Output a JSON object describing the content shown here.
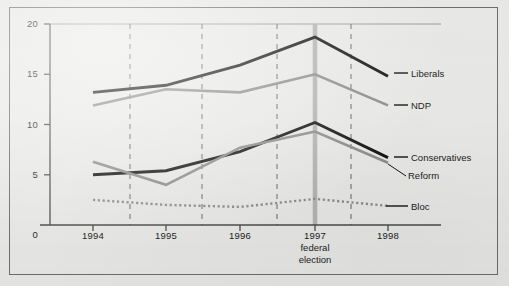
{
  "chart_data": {
    "type": "line",
    "title": "",
    "subtitle": "",
    "xlabel": "",
    "ylabel": "",
    "xlim": [
      1993.7,
      1998.3
    ],
    "ylim": [
      0,
      20
    ],
    "grid": "vertical-dashed-midyear",
    "legend_position": "right-inline",
    "y_ticks": [
      "0",
      "5",
      "10",
      "15",
      "20"
    ],
    "y_tick_values": [
      0,
      5,
      10,
      15,
      20
    ],
    "x_ticks": [
      "1994",
      "1995",
      "1996",
      "1997",
      "1998"
    ],
    "x_tick_values": [
      1994,
      1995,
      1996,
      1997,
      1998
    ],
    "annotation": {
      "line1": "1997",
      "line2": "federal",
      "line3": "election",
      "at_x": 1997,
      "marker_color": "#b4b4b4"
    },
    "x": [
      1994,
      1995,
      1996,
      1997,
      1998
    ],
    "series": [
      {
        "name": "Liberals",
        "label": "Liberals",
        "color": "#141414",
        "style": "solid",
        "width": 2.9,
        "values": [
          13.2,
          13.9,
          15.9,
          18.7,
          14.8
        ]
      },
      {
        "name": "NDP",
        "label": "NDP",
        "color": "#8d8d8d",
        "style": "solid",
        "width": 2.6,
        "values": [
          11.9,
          13.5,
          13.2,
          15.0,
          11.9
        ]
      },
      {
        "name": "Conservatives",
        "label": "Conservatives",
        "color": "#141414",
        "style": "solid",
        "width": 2.9,
        "values": [
          5.0,
          5.4,
          7.3,
          10.2,
          6.7
        ]
      },
      {
        "name": "Reform",
        "label": "Reform",
        "color": "#8d8d8d",
        "style": "solid",
        "width": 2.6,
        "values": [
          6.3,
          4.0,
          7.7,
          9.3,
          6.2
        ]
      },
      {
        "name": "Bloc",
        "label": "Bloc",
        "color": "#8d8d8d",
        "style": "dotted",
        "width": 2.4,
        "values": [
          2.5,
          2.0,
          1.8,
          2.6,
          1.9
        ]
      }
    ]
  },
  "axis": {
    "y_labels": [
      "20",
      "15",
      "10",
      "5",
      "0"
    ],
    "x_labels": [
      "1994",
      "1995",
      "1996",
      "1997",
      "1998"
    ]
  },
  "labels": {
    "liberals": "Liberals",
    "ndp": "NDP",
    "conservatives": "Conservatives",
    "reform": "Reform",
    "bloc": "Bloc",
    "year_1994": "1994",
    "year_1995": "1995",
    "year_1996": "1996",
    "year_1997": "1997",
    "year_1998": "1998",
    "y_20": "20",
    "y_15": "15",
    "y_10": "10",
    "y_5": "5",
    "y_0": "0",
    "election_1997": "1997",
    "election_federal": "federal",
    "election_election": "election"
  },
  "colors": {
    "background": "#e9e9e7",
    "frame": "#6e6e6e",
    "axis": "#4a4a4a",
    "dark_series": "#141414",
    "gray_series": "#8d8d8d",
    "gridline": "#7a7a7a",
    "election_marker": "#b4b4b4"
  }
}
